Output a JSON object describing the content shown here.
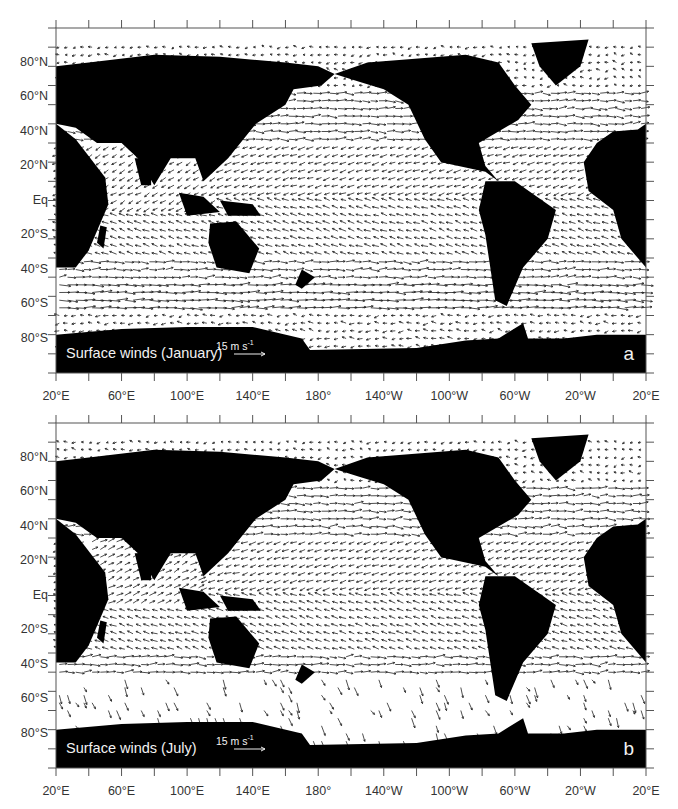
{
  "figure": {
    "panels": [
      {
        "id": "a",
        "title": "Surface winds (January)",
        "letter": "a",
        "scale_label": "15 m s",
        "scale_exp": "-1"
      },
      {
        "id": "b",
        "title": "Surface winds (July)",
        "letter": "b",
        "scale_label": "15 m s",
        "scale_exp": "-1"
      }
    ],
    "lat_labels": [
      "80°N",
      "60°N",
      "40°N",
      "20°N",
      "Eq",
      "20°S",
      "40°S",
      "60°S",
      "80°S"
    ],
    "lon_labels": [
      "20°E",
      "60°E",
      "100°E",
      "140°E",
      "180°",
      "140°W",
      "100°W",
      "60°W",
      "20°W",
      "20°E"
    ]
  },
  "chart_data": [
    {
      "type": "vector-field-map",
      "title": "Surface winds (January)",
      "panel": "a",
      "projection": "equirectangular, centred 200°E (20°E to 20°E)",
      "xlabel": "Longitude",
      "ylabel": "Latitude",
      "x_ticks": [
        "20°E",
        "60°E",
        "100°E",
        "140°E",
        "180°",
        "140°W",
        "100°W",
        "60°W",
        "20°W",
        "20°E"
      ],
      "y_ticks": [
        "80°N",
        "60°N",
        "40°N",
        "20°N",
        "Eq",
        "20°S",
        "40°S",
        "60°S",
        "80°S"
      ],
      "ylim": [
        -90,
        90
      ],
      "reference_vector": "15 m s-1",
      "land_color": "#000000",
      "ocean_color": "#ffffff",
      "features": [
        "NE trade winds 0-30°N across Pacific and Atlantic",
        "SE trade winds 0-30°S",
        "Strong westerlies 40-60°S Southern Ocean",
        "Northerly monsoon flow over Indian Ocean / South China Sea",
        "Cyclonic Aleutian and Icelandic low circulations"
      ]
    },
    {
      "type": "vector-field-map",
      "title": "Surface winds (July)",
      "panel": "b",
      "projection": "equirectangular, centred 200°E (20°E to 20°E)",
      "xlabel": "Longitude",
      "ylabel": "Latitude",
      "x_ticks": [
        "20°E",
        "60°E",
        "100°E",
        "140°E",
        "180°",
        "140°W",
        "100°W",
        "60°W",
        "20°W",
        "20°E"
      ],
      "y_ticks": [
        "80°N",
        "60°N",
        "40°N",
        "20°N",
        "Eq",
        "20°S",
        "40°S",
        "60°S",
        "80°S"
      ],
      "ylim": [
        -90,
        90
      ],
      "reference_vector": "15 m s-1",
      "land_color": "#000000",
      "ocean_color": "#ffffff",
      "features": [
        "Southwest monsoon over Arabian Sea / Bay of Bengal",
        "Anticyclonic subtropical highs in N Pacific and N Atlantic",
        "SE trades strengthen in Southern Hemisphere",
        "Sparse, large vectors south of 40°S (sea-ice edge)"
      ]
    }
  ]
}
